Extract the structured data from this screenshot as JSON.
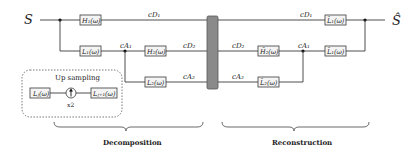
{
  "diagram": {
    "input_signal": "S",
    "output_signal": "Ŝ",
    "decomposition": {
      "filters": [
        {
          "id": "H1",
          "label": "H₁(ω)"
        },
        {
          "id": "L1",
          "label": "L₁(ω)"
        },
        {
          "id": "H2",
          "label": "H₂(ω)"
        },
        {
          "id": "L2",
          "label": "L₂(ω)"
        }
      ],
      "signals": {
        "cD1": "cD₁",
        "cA1": "cA₁",
        "cD2": "cD₂",
        "cA2": "cA₂"
      }
    },
    "reconstruction": {
      "filters": [
        {
          "id": "L1t_top",
          "label": "L̃₁(ω)"
        },
        {
          "id": "H2t",
          "label": "H̃₂(ω)"
        },
        {
          "id": "L1t_mid",
          "label": "L̃₁(ω)"
        },
        {
          "id": "L2t",
          "label": "L̃₂(ω)"
        }
      ],
      "signals": {
        "cD1": "cD₁",
        "cD2": "cD₂",
        "cA1": "cA₁",
        "cA2": "cA₂"
      }
    },
    "upsampling_inset": {
      "title": "Up sampling",
      "input_label": "Lⱼ(ω)",
      "factor": "x2",
      "output_label": "Lⱼ₊₁(ω)"
    },
    "captions": {
      "left": "Decomposition",
      "right": "Reconstruction"
    },
    "colors": {
      "center_bar": "#8a8a8a",
      "box_fill": "#f4f4f4",
      "line": "#3a3a3a"
    }
  }
}
